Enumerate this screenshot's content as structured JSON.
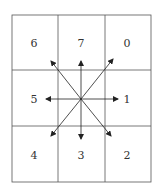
{
  "diagram": {
    "type": "freeman-chain-code-8-directions",
    "grid": {
      "rows": 3,
      "cols": 3
    },
    "cells": [
      [
        "6",
        "7",
        "0"
      ],
      [
        "5",
        "",
        "1"
      ],
      [
        "4",
        "3",
        "2"
      ]
    ],
    "arrows": [
      {
        "direction": "0",
        "to": "upper-right"
      },
      {
        "direction": "1",
        "to": "right"
      },
      {
        "direction": "2",
        "to": "lower-right"
      },
      {
        "direction": "3",
        "to": "down"
      },
      {
        "direction": "4",
        "to": "lower-left"
      },
      {
        "direction": "5",
        "to": "left"
      },
      {
        "direction": "6",
        "to": "upper-left"
      },
      {
        "direction": "7",
        "to": "up"
      }
    ],
    "colors": {
      "line": "#333333",
      "background": "#ffffff"
    }
  }
}
